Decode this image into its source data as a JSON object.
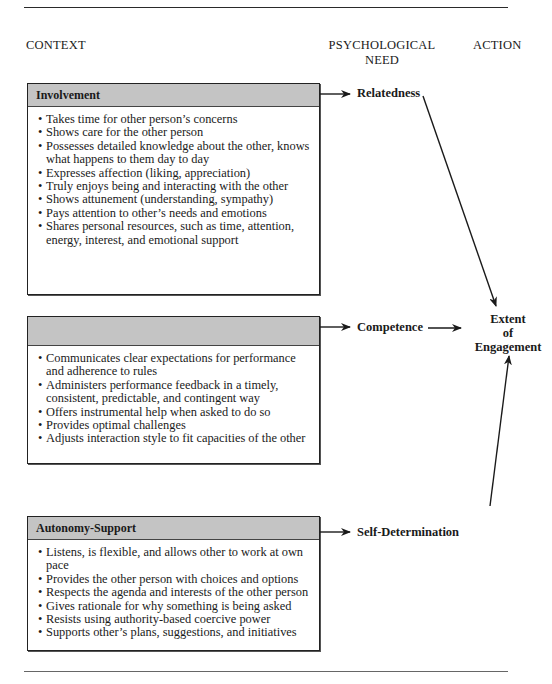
{
  "columns": {
    "context": "CONTEXT",
    "need_line1": "PSYCHOLOGICAL",
    "need_line2": "NEED",
    "action": "ACTION"
  },
  "boxes": [
    {
      "title": "Involvement",
      "need": "Relatedness",
      "items": [
        "Takes time for other person’s concerns",
        "Shows care for the other person",
        "Possesses detailed knowledge about the other, knows what happens to them day to day",
        "Expresses affection (liking, appreciation)",
        "Truly enjoys being and interacting with the other",
        "Shows attunement (understanding, sympathy)",
        "Pays attention to other’s needs and emotions",
        "Shares personal resources, such as time, attention, energy, interest, and emotional support"
      ]
    },
    {
      "title": "",
      "need": "Competence",
      "items": [
        "Communicates clear expectations for performance and adherence to rules",
        "Administers performance feedback in a timely, consistent, predictable, and contingent way",
        "Offers instrumental help when asked to do so",
        "Provides optimal challenges",
        "Adjusts interaction style to fit capacities of the other"
      ]
    },
    {
      "title": "Autonomy-Support",
      "need": "Self-Determination",
      "items": [
        "Listens, is flexible, and allows other to work at own pace",
        "Provides the other person with choices and options",
        "Respects the agenda and interests of the other person",
        "Gives rationale for why something is being asked",
        "Resists using authority-based coercive power",
        "Supports other’s plans, suggestions, and initiatives"
      ]
    }
  ],
  "outcome": {
    "line1": "Extent",
    "line2": "of",
    "line3": "Engagement"
  },
  "colors": {
    "box_header_fill": "#c4c4c4",
    "line": "#1a1a1a"
  }
}
